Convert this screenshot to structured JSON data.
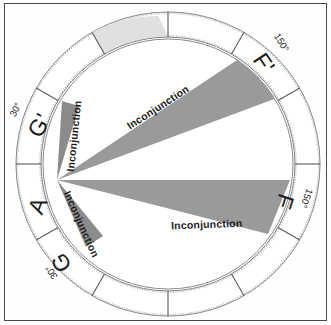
{
  "figure": {
    "type": "astrological-aspect-diagram"
  },
  "colors": {
    "frame": "#4a4a4a",
    "ring_line": "#6f6f6f",
    "inner_circle": "#8a8a8a",
    "wedge_fill": "#9a9a9a",
    "wedge_fill_dark": "#8b8b8b",
    "highlight_sector": "#e0e0e0",
    "background": "#fefefe",
    "text": "#1c1c1c"
  },
  "wheel": {
    "sector_count": 12,
    "center": {
      "x": 168,
      "y": 164
    },
    "outer_radius": 152,
    "ring_inner_radius": 127,
    "inner_circle_radius": 125,
    "apex": {
      "x": 57,
      "y": 180
    }
  },
  "sectors": [
    {
      "id": "A",
      "label": "A",
      "highlighted": true,
      "angle_deg": 180
    },
    {
      "id": "Gp",
      "label": "G'",
      "highlighted": false,
      "angle_deg": 210
    },
    {
      "id": "G",
      "label": "G",
      "highlighted": false,
      "angle_deg": 150
    },
    {
      "id": "Fp",
      "label": "F'",
      "highlighted": false,
      "angle_deg": 330
    },
    {
      "id": "F",
      "label": "F",
      "highlighted": false,
      "angle_deg": 30
    }
  ],
  "degree_labels": [
    {
      "id": "deg-Gp",
      "text": "30°"
    },
    {
      "id": "deg-G",
      "text": "30°"
    },
    {
      "id": "deg-Fp",
      "text": "150°"
    },
    {
      "id": "deg-F",
      "text": "150°"
    }
  ],
  "aspect_wedges": [
    {
      "id": "wedge-upper-major",
      "label": "Inconjunction",
      "target": "F'",
      "size": "major"
    },
    {
      "id": "wedge-lower-major",
      "label": "Inconjunction",
      "target": "F",
      "size": "major"
    },
    {
      "id": "wedge-upper-minor",
      "label": "Inconjunction",
      "target": "G'",
      "size": "minor"
    },
    {
      "id": "wedge-lower-minor",
      "label": "Inconjunction",
      "target": "G",
      "size": "minor"
    }
  ],
  "aspect_label_text": "Inconjunction"
}
